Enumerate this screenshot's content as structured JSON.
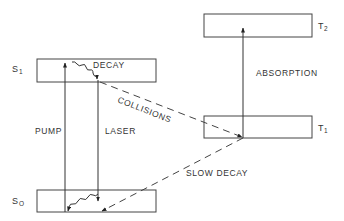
{
  "diagram": {
    "colors": {
      "line": "#333333",
      "background": "#ffffff"
    },
    "states": [
      {
        "id": "S1",
        "label": "S",
        "subscript": "1",
        "x": 37,
        "y": 59,
        "w": 119,
        "h": 23
      },
      {
        "id": "S0",
        "label": "S",
        "subscript": "O",
        "x": 37,
        "y": 190,
        "w": 119,
        "h": 22
      },
      {
        "id": "T2",
        "label": "T",
        "subscript": "2",
        "x": 204,
        "y": 14,
        "w": 108,
        "h": 23
      },
      {
        "id": "T1",
        "label": "T",
        "subscript": "1",
        "x": 204,
        "y": 116,
        "w": 108,
        "h": 22
      }
    ],
    "transitions": [
      {
        "id": "pump",
        "label": "PUMP",
        "from": "S0",
        "to": "S1",
        "style": "solid"
      },
      {
        "id": "laser",
        "label": "LASER",
        "from": "S1",
        "to": "S0",
        "style": "solid"
      },
      {
        "id": "decay",
        "label": "DECAY",
        "within": "S1",
        "style": "wavy"
      },
      {
        "id": "s0-relax",
        "label": "",
        "within": "S0",
        "style": "wavy"
      },
      {
        "id": "collisions",
        "label": "COLLISIONS",
        "from": "S1",
        "to": "T1",
        "style": "dashed"
      },
      {
        "id": "slow-decay",
        "label": "SLOW DECAY",
        "from": "T1",
        "to": "S0",
        "style": "dashed"
      },
      {
        "id": "absorption",
        "label": "ABSORPTION",
        "from": "T1",
        "to": "T2",
        "style": "solid"
      }
    ],
    "labels": {
      "s1": "S",
      "s1_sub": "1",
      "s0": "S",
      "s0_sub": "O",
      "t2": "T",
      "t2_sub": "2",
      "t1": "T",
      "t1_sub": "1",
      "decay": "DECAY",
      "collisions": "COLLISIONS",
      "absorption": "ABSORPTION",
      "pump": "PUMP",
      "laser": "LASER",
      "slow_decay": "SLOW DECAY"
    }
  }
}
